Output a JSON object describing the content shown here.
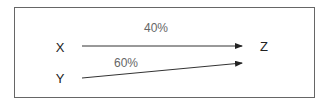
{
  "diagram": {
    "nodes": [
      {
        "id": "X",
        "label": "X"
      },
      {
        "id": "Y",
        "label": "Y"
      },
      {
        "id": "Z",
        "label": "Z"
      }
    ],
    "edges": [
      {
        "from": "X",
        "to": "Z",
        "label": "40%"
      },
      {
        "from": "Y",
        "to": "Z",
        "label": "60%"
      }
    ]
  }
}
